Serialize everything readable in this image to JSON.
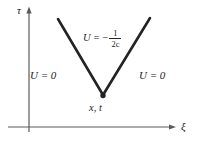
{
  "figure": {
    "type": "diagram",
    "name": "characteristic-cone-diagram",
    "background_color": "#ffffff",
    "line_color": "#232323",
    "axis_color": "#4a4a4a",
    "axes": {
      "vertical": {
        "label": "τ",
        "name": "tau-axis",
        "origin_x": 29,
        "top_y": 8,
        "bottom_y": 132
      },
      "horizontal": {
        "label": "ξ",
        "name": "xi-axis",
        "y": 127,
        "left_x": 8,
        "right_x": 174
      }
    },
    "regions": [
      {
        "name": "left-region",
        "label": "U = 0"
      },
      {
        "name": "right-region",
        "label": "U = 0"
      }
    ],
    "interior_label": {
      "lhs": "U",
      "equals": "=",
      "sign": "−",
      "numerator": "1",
      "denominator": "2c",
      "full_text": "U = -1/(2c)"
    },
    "apex": {
      "label": "x, t",
      "x": 103,
      "y": 96,
      "dot_radius": 2.6
    },
    "v_shape": {
      "left_arm": {
        "x1": 58,
        "y1": 19,
        "x2": 103,
        "y2": 96
      },
      "right_arm": {
        "x1": 103,
        "y1": 96,
        "x2": 150,
        "y2": 18
      },
      "stroke_width": 2.6
    }
  }
}
